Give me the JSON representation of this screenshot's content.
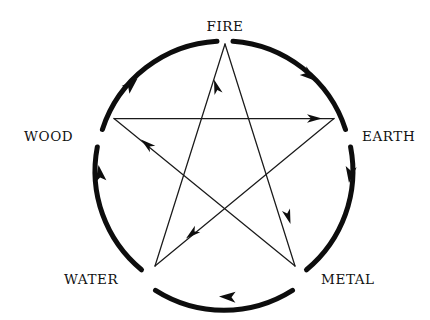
{
  "diagram": {
    "type": "pentagram-cycle",
    "canvas": {
      "width": 430,
      "height": 320
    },
    "colors": {
      "stroke": "#0d0d0d",
      "label": "#111111",
      "background": "#ffffff",
      "star_line": "#1a1a1a"
    },
    "circle": {
      "center_x": 224,
      "center_y": 169,
      "radius": 128,
      "stroke_width": 5,
      "direction": "clockwise",
      "meaning": "generating cycle"
    },
    "star": {
      "stroke_width": 1.2,
      "meaning": "overcoming cycle"
    },
    "labels": {
      "fire": "FIRE",
      "wood": "WOOD",
      "earth": "EARTH",
      "water": "WATER",
      "metal": "METAL"
    },
    "nodes": [
      {
        "id": "fire",
        "label": "FIRE",
        "x": 225,
        "y": 44,
        "label_x": 225,
        "label_y": 28,
        "angle_deg": -90
      },
      {
        "id": "earth",
        "label": "EARTH",
        "x": 334,
        "y": 119,
        "label_x": 386,
        "label_y": 137,
        "angle_deg": -18
      },
      {
        "id": "metal",
        "label": "METAL",
        "x": 295,
        "y": 266,
        "label_x": 348,
        "label_y": 281,
        "angle_deg": 54
      },
      {
        "id": "water",
        "label": "WATER",
        "x": 155,
        "y": 266,
        "label_x": 95,
        "label_y": 281,
        "angle_deg": 126
      },
      {
        "id": "wood",
        "label": "WOOD",
        "x": 114,
        "y": 118,
        "label_x": 55,
        "label_y": 137,
        "angle_deg": 198
      }
    ],
    "outer_cycle": {
      "name": "generating cycle",
      "sequence": [
        "wood",
        "fire",
        "earth",
        "metal",
        "water",
        "wood"
      ],
      "arrow_count": 5
    },
    "inner_cycle": {
      "name": "overcoming cycle",
      "edges": [
        {
          "from": "wood",
          "to": "earth"
        },
        {
          "from": "earth",
          "to": "water"
        },
        {
          "from": "water",
          "to": "fire"
        },
        {
          "from": "fire",
          "to": "metal"
        },
        {
          "from": "metal",
          "to": "wood"
        }
      ],
      "arrow_count": 5
    }
  }
}
